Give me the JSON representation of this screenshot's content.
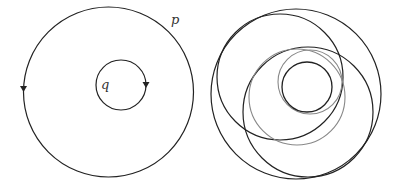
{
  "left_figure": {
    "outer_circle": {
      "label": "p",
      "cx": 108.5,
      "cy": 92,
      "r": 85,
      "color": "#222222",
      "direction_arrow": "counterclockwise (down at left)"
    },
    "inner_circle": {
      "label": "q",
      "cx": 121,
      "cy": 85,
      "r": 25,
      "color": "#222222",
      "direction_arrow": "clockwise (down at right)"
    }
  },
  "right_figure": {
    "circles": [
      {
        "name": "outer",
        "cx": 296,
        "cy": 94,
        "r": 85,
        "color": "#222222"
      },
      {
        "name": "upper-left",
        "cx": 280,
        "cy": 77,
        "r": 63,
        "color": "#222222"
      },
      {
        "name": "lower-right",
        "cx": 308,
        "cy": 112,
        "r": 65,
        "color": "#222222"
      },
      {
        "name": "gray-medium",
        "cx": 297,
        "cy": 97,
        "r": 48,
        "color": "#888888"
      },
      {
        "name": "gray-small",
        "cx": 310,
        "cy": 82,
        "r": 32,
        "color": "#888888"
      },
      {
        "name": "inner",
        "cx": 307,
        "cy": 87,
        "r": 25,
        "color": "#222222"
      }
    ]
  },
  "labels": {
    "p": "p",
    "q": "q"
  }
}
